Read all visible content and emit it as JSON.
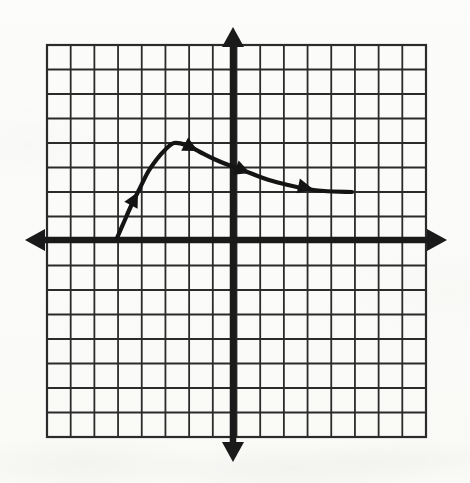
{
  "figure": {
    "kind": "coordinate-grid-graph",
    "background_color": "#fdfdfc",
    "ink_color": "#1a1a1a",
    "grid_line_color": "#2b2b2b"
  },
  "grid": {
    "left_px": 47,
    "top_px": 45,
    "right_px": 426,
    "bottom_px": 437,
    "columns": 16,
    "rows": 16,
    "cell_width_px": 23.69,
    "cell_height_px": 24.5,
    "grid_line_width_px": 1.8,
    "border_line_width_px": 2.2,
    "show_grid": true
  },
  "axes": {
    "x_axis": {
      "label": "x-axis",
      "y_px": 240,
      "start_px": 25,
      "end_px": 447,
      "line_width_px": 6.5,
      "arrow_left": true,
      "arrow_right": true,
      "arrow_half_width_px": 11,
      "arrow_length_px": 20
    },
    "y_axis": {
      "label": "y-axis",
      "x_px": 233,
      "start_px": 27,
      "end_px": 462,
      "line_width_px": 6.5,
      "arrow_up": true,
      "arrow_down": true,
      "arrow_half_width_px": 11,
      "arrow_length_px": 20
    },
    "origin_px": {
      "x": 233,
      "y": 240
    },
    "units_per_cell": 1,
    "x_range": [
      -8,
      8
    ],
    "y_range": [
      -8,
      8
    ],
    "tick_labels_shown": false
  },
  "chart_data": {
    "type": "line",
    "title": "",
    "xlabel": "",
    "ylabel": "",
    "xlim": [
      -8,
      8
    ],
    "ylim": [
      -8,
      8
    ],
    "grid": true,
    "legend": "none",
    "series": [
      {
        "name": "curve",
        "stroke_color": "#141414",
        "stroke_width_px": 4.2,
        "direction_arrows": 4,
        "x": [
          -4.9,
          -4.6,
          -4.2,
          -3.7,
          -3.1,
          -2.6,
          -2.2,
          -1.8,
          -1.2,
          -0.6,
          0.0,
          0.7,
          1.5,
          2.3,
          3.1,
          3.9,
          4.6,
          5.0
        ],
        "y": [
          0.0,
          0.7,
          1.3,
          2.0,
          2.8,
          3.4,
          3.8,
          4.0,
          3.9,
          3.6,
          3.3,
          3.0,
          2.7,
          2.4,
          2.2,
          2.05,
          1.97,
          1.95
        ],
        "points_px": [
          {
            "x": 117,
            "y": 238
          },
          {
            "x": 124,
            "y": 222
          },
          {
            "x": 131,
            "y": 206
          },
          {
            "x": 139,
            "y": 190
          },
          {
            "x": 148,
            "y": 172
          },
          {
            "x": 157,
            "y": 159
          },
          {
            "x": 165,
            "y": 150
          },
          {
            "x": 174,
            "y": 143
          },
          {
            "x": 186,
            "y": 145
          },
          {
            "x": 200,
            "y": 152
          },
          {
            "x": 214,
            "y": 159
          },
          {
            "x": 231,
            "y": 166
          },
          {
            "x": 250,
            "y": 173
          },
          {
            "x": 269,
            "y": 180
          },
          {
            "x": 288,
            "y": 185
          },
          {
            "x": 307,
            "y": 189
          },
          {
            "x": 324,
            "y": 191
          },
          {
            "x": 352,
            "y": 192
          }
        ],
        "arrowheads_px": [
          {
            "x": 138,
            "y": 192,
            "angle_deg": -62,
            "size_px": 15
          },
          {
            "x": 198,
            "y": 151,
            "angle_deg": 27,
            "size_px": 15
          },
          {
            "x": 250,
            "y": 173,
            "angle_deg": 21,
            "size_px": 15
          },
          {
            "x": 313,
            "y": 189,
            "angle_deg": 12,
            "size_px": 15
          }
        ],
        "start_description": "begins on the x-axis near x = -5",
        "peak_description": "maximum near (-1.8, 4)",
        "end_description": "levels off near y = 2 at the right"
      }
    ]
  },
  "annotations": {
    "scan_artifact": "faint scanner smudges along the bottom margin"
  }
}
